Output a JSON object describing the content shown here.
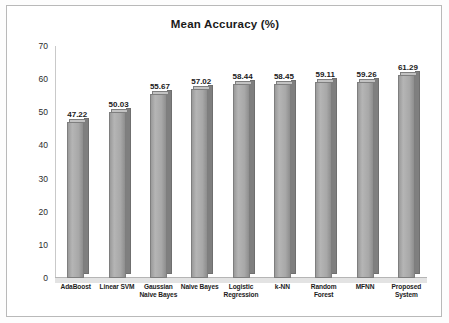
{
  "figure": {
    "title": "Mean Accuracy (%)"
  },
  "chart_data": {
    "type": "bar",
    "title": "Mean Accuracy (%)",
    "xlabel": "",
    "ylabel": "",
    "ylim": [
      0,
      70
    ],
    "yticks": [
      "0",
      "10",
      "20",
      "30",
      "40",
      "50",
      "60",
      "70"
    ],
    "grid": false,
    "legend": "none",
    "categories": [
      "AdaBoost",
      "Linear SVM",
      "Gaussian\nNaive Bayes",
      "Naive Bayes",
      "Logistic\nRegression",
      "k-NN",
      "Random\nForest",
      "MFNN",
      "Proposed\nSystem"
    ],
    "category_lines": [
      [
        "AdaBoost"
      ],
      [
        "Linear SVM"
      ],
      [
        "Gaussian",
        "Naive Bayes"
      ],
      [
        "Naive Bayes"
      ],
      [
        "Logistic",
        "Regression"
      ],
      [
        "k-NN"
      ],
      [
        "Random",
        "Forest"
      ],
      [
        "MFNN"
      ],
      [
        "Proposed",
        "System"
      ]
    ],
    "values": [
      47.22,
      50.03,
      55.67,
      57.02,
      58.44,
      58.45,
      59.11,
      59.26,
      61.29
    ],
    "value_labels": [
      "47.22",
      "50.03",
      "55.67",
      "57.02",
      "58.44",
      "58.45",
      "59.11",
      "59.26",
      "61.29"
    ],
    "bar_color": "#a9a9a9"
  }
}
